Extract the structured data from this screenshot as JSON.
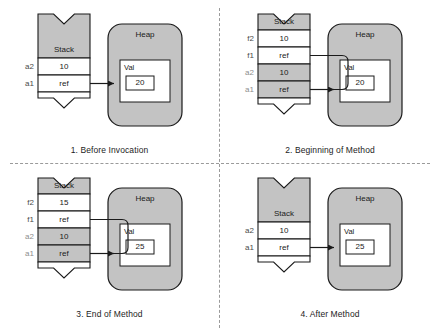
{
  "figure": {
    "panels": [
      {
        "caption": "1. Before Invocation",
        "stack_title": "Stack",
        "heap_title": "Heap",
        "object_title": "Val",
        "object_value": "20",
        "frames": [
          {
            "label": "a2",
            "value": "10",
            "state": "active"
          },
          {
            "label": "a1",
            "value": "ref",
            "state": "active"
          }
        ],
        "arrows": [
          "a1"
        ]
      },
      {
        "caption": "2. Beginning of Method",
        "stack_title": "Stack",
        "heap_title": "Heap",
        "object_title": "Val",
        "object_value": "20",
        "frames": [
          {
            "label": "f2",
            "value": "10",
            "state": "active"
          },
          {
            "label": "f1",
            "value": "ref",
            "state": "active"
          },
          {
            "label": "a2",
            "value": "10",
            "state": "inactive"
          },
          {
            "label": "a1",
            "value": "ref",
            "state": "inactive"
          }
        ],
        "arrows": [
          "f1",
          "a1"
        ]
      },
      {
        "caption": "3. End of Method",
        "stack_title": "Stack",
        "heap_title": "Heap",
        "object_title": "Val",
        "object_value": "25",
        "frames": [
          {
            "label": "f2",
            "value": "15",
            "state": "active"
          },
          {
            "label": "f1",
            "value": "ref",
            "state": "active"
          },
          {
            "label": "a2",
            "value": "10",
            "state": "inactive"
          },
          {
            "label": "a1",
            "value": "ref",
            "state": "inactive"
          }
        ],
        "arrows": [
          "f1",
          "a1"
        ]
      },
      {
        "caption": "4. After Method",
        "stack_title": "Stack",
        "heap_title": "Heap",
        "object_title": "Val",
        "object_value": "25",
        "frames": [
          {
            "label": "a2",
            "value": "10",
            "state": "active"
          },
          {
            "label": "a1",
            "value": "ref",
            "state": "active"
          }
        ],
        "arrows": [
          "a1"
        ]
      }
    ],
    "colors": {
      "shade_gray": "#c3c3c3",
      "stroke": "#1a1a1a",
      "label_gray": "#7d7d7d",
      "white": "#ffffff",
      "divider": "#9a9a9a"
    }
  }
}
